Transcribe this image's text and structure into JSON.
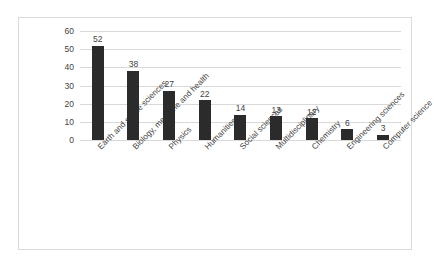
{
  "chart_data": {
    "type": "bar",
    "title": "",
    "subtitle": "",
    "xlabel": "",
    "ylabel": "",
    "ylim": [
      0,
      60
    ],
    "yticks": [
      0,
      10,
      20,
      30,
      40,
      50,
      60
    ],
    "grid": true,
    "legend": false,
    "legend_position": "none",
    "bar_color": "#2b2b2b",
    "gridline_color": "#d9d9d9",
    "border_color": "#d9d9d9",
    "label_color": "#3f3f3f",
    "categories": [
      "Earth and space sciences",
      "Biology, medicine and health",
      "Physics",
      "Humanities",
      "Social sciences",
      "Multidisciplinary",
      "Chemistry",
      "Engineering sciences",
      "Computer science"
    ],
    "values": [
      52,
      38,
      27,
      22,
      14,
      13,
      12,
      6,
      3
    ],
    "data_labels": [
      "52",
      "38",
      "27",
      "22",
      "14",
      "13",
      "12",
      "6",
      "3"
    ],
    "ytick_labels": [
      "0",
      "10",
      "20",
      "30",
      "40",
      "50",
      "60"
    ]
  }
}
